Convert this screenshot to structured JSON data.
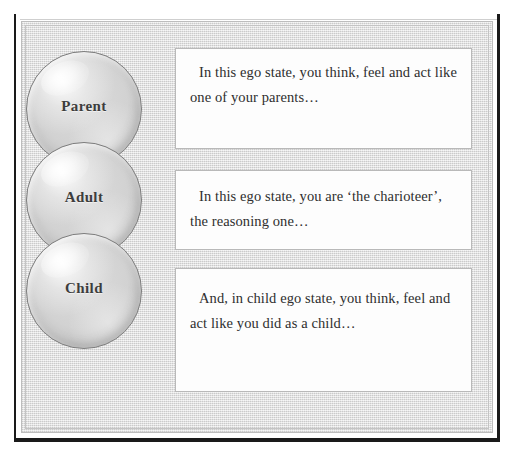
{
  "figure": {
    "background_color": "#ffffff",
    "panel_color": "#d9d9d9",
    "box_color": "#fdfdfd",
    "border_color": "#b9b9b9",
    "text_color": "#2e2e2e"
  },
  "ego_states": [
    {
      "id": "parent",
      "label": "Parent",
      "description": "In this ego state, you think, feel and act like one of your parents…"
    },
    {
      "id": "adult",
      "label": "Adult",
      "description": "In this ego state, you are ‘the charioteer’, the reasoning one…"
    },
    {
      "id": "child",
      "label": "Child",
      "description": "And, in child ego state, you think, feel and act like you did as a child…"
    }
  ],
  "artifact": {
    "mark": "··"
  }
}
